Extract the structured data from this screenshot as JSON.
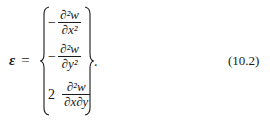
{
  "equation": {
    "lhs_symbol": "ε",
    "equals": "=",
    "rows": [
      {
        "prefix": "−",
        "numerator": "∂²w",
        "denominator": "∂x²"
      },
      {
        "prefix": "−",
        "numerator": "∂²w",
        "denominator": "∂y²"
      },
      {
        "prefix": "2",
        "numerator": "∂²w",
        "denominator": "∂x∂y"
      }
    ],
    "trailing_punct": ".",
    "number": "(10.2)"
  }
}
